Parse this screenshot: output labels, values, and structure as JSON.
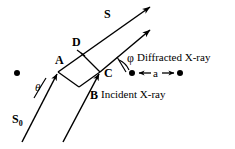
{
  "figure": {
    "type": "xray-diffraction-geometry-diagram",
    "background_color": "#ffffff",
    "stroke_color": "#000000"
  },
  "labels": {
    "scattered_beam": "S",
    "incident_beam": "S",
    "incident_beam_subscript": "0",
    "point_a": "A",
    "point_b": "B",
    "point_c": "C",
    "point_d": "D",
    "angle_theta": "θ",
    "angle_phi": "φ",
    "spacing": "a",
    "diffracted_text": "Diffracted X-ray",
    "incident_text": "Incident X-ray"
  },
  "atoms": [
    {
      "name": "atom-left",
      "cx": 17,
      "cy": 73,
      "r": 3
    },
    {
      "name": "atom-scale-left",
      "cx": 132,
      "cy": 73,
      "r": 3
    },
    {
      "name": "atom-scale-right",
      "cx": 180,
      "cy": 73,
      "r": 3
    }
  ],
  "geometry": {
    "point_a": {
      "x": 58,
      "y": 72
    },
    "point_c": {
      "x": 100,
      "y": 72
    },
    "point_d": {
      "x": 81,
      "y": 52
    },
    "point_b": {
      "x": 78,
      "y": 86
    },
    "scattered_ray_upper_tip": {
      "x": 152,
      "y": 5
    },
    "scattered_ray_lower_tip": {
      "x": 152,
      "y": 28
    },
    "incident_ray_left_start": {
      "x": 22,
      "y": 142
    },
    "incident_ray_right_start": {
      "x": 63,
      "y": 142
    },
    "spacing_arrow_left": {
      "x": 138,
      "y": 73
    },
    "spacing_arrow_right": {
      "x": 174,
      "y": 73
    }
  }
}
